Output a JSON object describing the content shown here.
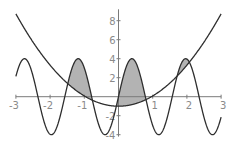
{
  "chart_data": {
    "type": "line",
    "title": "",
    "xlabel": "",
    "ylabel": "",
    "xlim": [
      -3,
      3
    ],
    "ylim": [
      -4.2,
      9.2
    ],
    "grid": false,
    "legend": null,
    "x_ticks": [
      -3,
      -2,
      -1,
      1,
      2,
      3
    ],
    "x_tick_labels": [
      "-3",
      "-2",
      "-1",
      "1",
      "2",
      "3"
    ],
    "y_ticks": [
      -4,
      -2,
      2,
      4,
      6,
      8
    ],
    "y_tick_labels": [
      "-4",
      "-2",
      "2",
      "4",
      "6",
      "8"
    ],
    "series": [
      {
        "name": "parabola",
        "expression": "y = 1.08 x^2 - 1",
        "a": 1.08,
        "c": -1,
        "color": "#2e2e2e",
        "points": [
          [
            -3,
            8.7
          ],
          [
            -2,
            3.3
          ],
          [
            -1,
            0.1
          ],
          [
            0,
            -1
          ],
          [
            1,
            0.1
          ],
          [
            2,
            3.3
          ],
          [
            3,
            8.7
          ]
        ]
      },
      {
        "name": "sinusoid",
        "expression": "y = 4 sin(4x)",
        "amplitude": 4,
        "frequency": 4,
        "color": "#2e2e2e",
        "points": [
          [
            -2.75,
            4
          ],
          [
            -2.36,
            0
          ],
          [
            -1.96,
            -4
          ],
          [
            -1.18,
            4
          ],
          [
            -0.39,
            -4
          ],
          [
            0,
            0
          ],
          [
            0.39,
            4
          ],
          [
            0.79,
            0
          ],
          [
            1.18,
            -4
          ],
          [
            1.96,
            4
          ],
          [
            2.75,
            -4
          ]
        ]
      }
    ],
    "shaded_regions": {
      "description": "Area between curves where sinusoid is above parabola",
      "color": "#b3b3b3",
      "approx_x_intervals": [
        [
          -1.5,
          -0.9
        ],
        [
          -0.05,
          0.85
        ],
        [
          1.65,
          2.15
        ]
      ]
    }
  },
  "layout": {
    "x_origin_px": 118.5,
    "x_scale_px": 34.2,
    "y_origin_px": 96.7,
    "y_scale_px": 9.5
  }
}
